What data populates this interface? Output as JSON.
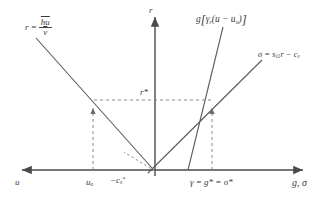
{
  "figure": {
    "axes": {
      "vertical_label": "r",
      "horizontal_label_right": "g, σ",
      "horizontal_label_left": "u",
      "origin_x": 155,
      "origin_y": 170
    },
    "tick_labels": {
      "u0": "u",
      "u0_sub": "o",
      "neg_cs": "−c",
      "neg_cs_sub": "s",
      "neg_cs_sup": "*",
      "gamma_solution": "γ = g* = σ*",
      "r_star": "r*"
    },
    "curves": [
      {
        "name": "r-equals-hu-over-v",
        "label_lhs": "r =",
        "label_numerator": "hu",
        "label_denominator": "v",
        "color": "#5a5a5a",
        "description": "descending straight line, r = h̄u / v̄"
      },
      {
        "name": "g-gamma-r-bracket",
        "label": "g[γr(u−uo)]",
        "label_head": "g",
        "label_gamma": "γ",
        "label_gamma_sub": "r",
        "label_inner": "(u − u",
        "label_inner_sub": "o",
        "label_inner_close": ")",
        "color": "#5a5a5a",
        "description": "steep ascending line from the g-axis"
      },
      {
        "name": "sigma-line",
        "label_lhs": "σ = s",
        "label_sub": "11",
        "label_mid": "r − c",
        "label_sub2": "s",
        "color": "#5a5a5a",
        "description": "shallow ascending line, σ = s11 r − cs"
      }
    ],
    "intersections": [
      {
        "name": "left-solution-point",
        "x": 93,
        "y": 103
      },
      {
        "name": "right-solution-point",
        "x": 212,
        "y": 100
      }
    ],
    "colors": {
      "line": "#5a5a5a",
      "axis": "#4a4a4a",
      "dashed": "#8a8a8a",
      "text": "#3a3a3a",
      "background": "#ffffff"
    }
  }
}
